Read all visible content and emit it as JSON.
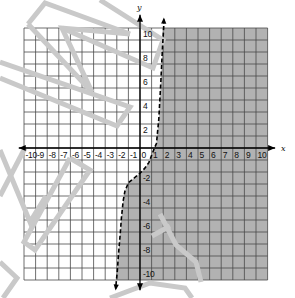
{
  "chart_data": {
    "type": "line",
    "title": "",
    "subtitle": "",
    "xlabel": "x",
    "ylabel": "y",
    "xlim": [
      -10,
      11
    ],
    "ylim": [
      -11,
      10
    ],
    "grid": true,
    "legend": null,
    "x_tick_labels": [
      "-10",
      "-9",
      "-8",
      "-7",
      "-6",
      "-5",
      "-4",
      "-3",
      "-2",
      "-1",
      "0",
      "1",
      "2",
      "3",
      "4",
      "5",
      "6",
      "7",
      "8",
      "9",
      "10"
    ],
    "y_tick_labels": [
      "10",
      "8",
      "6",
      "4",
      "2",
      "-2",
      "-4",
      "-6",
      "-8",
      "-10"
    ],
    "series": [
      {
        "name": "boundary curve",
        "style": "dashed",
        "color": "#000000",
        "arrows": "both ends",
        "points": [
          [
            2.06,
            10.7
          ],
          [
            2.04,
            10.0
          ],
          [
            1.93,
            8.2
          ],
          [
            1.79,
            5.4
          ],
          [
            1.62,
            2.4
          ],
          [
            1.42,
            0.4
          ],
          [
            1.1,
            -0.35
          ],
          [
            0.77,
            -1.2
          ],
          [
            0.4,
            -1.7
          ],
          [
            0.0,
            -2.1
          ],
          [
            -0.5,
            -2.5
          ],
          [
            -1.0,
            -2.9
          ],
          [
            -1.3,
            -3.6
          ],
          [
            -1.45,
            -4.4
          ],
          [
            -1.6,
            -5.8
          ],
          [
            -1.7,
            -7.1
          ],
          [
            -1.85,
            -8.8
          ],
          [
            -1.96,
            -10.3
          ],
          [
            -2.1,
            -11.7
          ]
        ]
      }
    ],
    "shaded_region": {
      "side": "right of curve",
      "color": "#b2b2b2"
    }
  },
  "colors": {
    "background": "#ffffff",
    "grid": "#4a4a4a",
    "axis": "#000000",
    "shade": "#b2b2b2",
    "watermark": "#c9c9c9"
  },
  "watermark": [
    [
      [
        28,
        24
      ],
      [
        45,
        3
      ],
      [
        130,
        34
      ]
    ],
    [
      [
        28,
        24
      ],
      [
        92,
        92
      ],
      [
        62,
        28
      ],
      [
        130,
        34
      ]
    ],
    [
      [
        100,
        0
      ],
      [
        163,
        40
      ],
      [
        153,
        68
      ],
      [
        62,
        28
      ]
    ],
    [
      [
        0,
        62
      ],
      [
        130,
        107
      ],
      [
        117,
        126
      ],
      [
        0,
        78
      ]
    ],
    [
      [
        25,
        148
      ],
      [
        0,
        196
      ]
    ],
    [
      [
        0,
        150
      ],
      [
        30,
        222
      ],
      [
        46,
        196
      ]
    ],
    [
      [
        70,
        158
      ],
      [
        90,
        170
      ],
      [
        35,
        250
      ],
      [
        24,
        242
      ],
      [
        70,
        158
      ]
    ],
    [
      [
        0,
        262
      ],
      [
        17,
        278
      ],
      [
        3,
        298
      ]
    ],
    [
      [
        110,
        298
      ],
      [
        150,
        283
      ],
      [
        185,
        288
      ],
      [
        192,
        298
      ]
    ],
    [
      [
        160,
        214
      ],
      [
        176,
        245
      ],
      [
        196,
        262
      ],
      [
        201,
        282
      ]
    ],
    [
      [
        152,
        236
      ],
      [
        170,
        226
      ]
    ]
  ]
}
